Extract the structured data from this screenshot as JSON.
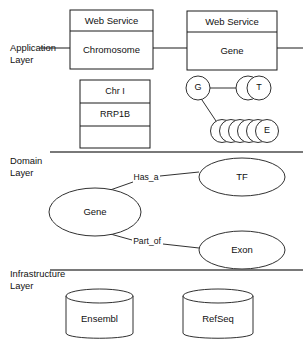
{
  "diagram": {
    "background": "#ffffff",
    "stroke_color": "#1a1a1a",
    "divider_color": "#4c4c4c"
  },
  "layers": [
    {
      "id": "application",
      "label": "Application\nLayer"
    },
    {
      "id": "domain",
      "label": "Domain\nLayer"
    },
    {
      "id": "infrastructure",
      "label": "Infrastructure\nLayer"
    }
  ],
  "application_layer": {
    "web_services": [
      {
        "id": "ws-chromosome",
        "header": "Web Service",
        "body": "Chromosome"
      },
      {
        "id": "ws-gene",
        "header": "Web Service",
        "body": "Gene"
      }
    ],
    "record_table": {
      "id": "chromosome-record-table",
      "rows": [
        "Chr I",
        "RRP1B",
        ""
      ]
    },
    "object_graph": {
      "root": {
        "id": "node-g",
        "label": "G"
      },
      "children": [
        {
          "id": "node-t",
          "label": "T",
          "stack_count": 2
        },
        {
          "id": "node-e",
          "label": "E",
          "stack_count": 6
        }
      ]
    }
  },
  "domain_layer": {
    "entities": [
      {
        "id": "entity-gene",
        "label": "Gene"
      },
      {
        "id": "entity-tf",
        "label": "TF"
      },
      {
        "id": "entity-exon",
        "label": "Exon"
      }
    ],
    "relations": [
      {
        "id": "relation-has-a",
        "label": "Has_a",
        "from": "Gene",
        "to": "TF"
      },
      {
        "id": "relation-part-of",
        "label": "Part_of",
        "from": "Gene",
        "to": "Exon"
      }
    ]
  },
  "infrastructure_layer": {
    "databases": [
      {
        "id": "db-ensembl",
        "label": "Ensembl"
      },
      {
        "id": "db-refseq",
        "label": "RefSeq"
      }
    ]
  }
}
